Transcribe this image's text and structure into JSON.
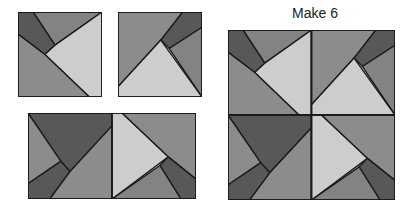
{
  "title": "Make 6",
  "colors": {
    "light": "#cdcdcd",
    "medium": "#8c8c8c",
    "medium_top": "#838383",
    "dark": "#585858",
    "border": "#1a1a1a"
  },
  "units": {
    "block_a": [
      {
        "name": "top-wedge",
        "fill": "medium_top",
        "points": "18,0 100,0 44,39"
      },
      {
        "name": "strip",
        "fill": "dark",
        "points": "0,0 18,0 44,39 32,50 0,26"
      },
      {
        "name": "big-triangle",
        "fill": "light",
        "points": "100,0 100,100 85,100 32,50 44,39"
      },
      {
        "name": "bottom-left",
        "fill": "medium",
        "points": "0,26 32,50 85,100 0,100"
      }
    ],
    "block_b": [
      {
        "name": "top-left",
        "fill": "medium",
        "points": "0,0 77,0 51,33 0,88"
      },
      {
        "name": "strip",
        "fill": "dark",
        "points": "77,0 100,0 100,18 61,43 51,33"
      },
      {
        "name": "right-wedge",
        "fill": "medium_top",
        "points": "100,18 100,100 61,43"
      },
      {
        "name": "big-triangle",
        "fill": "light",
        "points": "51,33 100,100 0,100 0,88"
      }
    ],
    "block_c": [
      {
        "name": "big-triangle",
        "fill": "dark",
        "points": "0,0 100,0 100,15 50,68 39,56"
      },
      {
        "name": "strip",
        "fill": "dark",
        "points": "0,100 0,82 39,56 50,68 26,100"
      },
      {
        "name": "left-wedge",
        "fill": "medium",
        "points": "0,0 39,56 0,82"
      },
      {
        "name": "bottom-right",
        "fill": "medium",
        "points": "100,15 100,100 26,100 50,68"
      }
    ],
    "block_d": [
      {
        "name": "big-triangle",
        "fill": "light",
        "points": "0,0 12,0 67,51 0,100"
      },
      {
        "name": "top-right",
        "fill": "medium",
        "points": "12,0 100,0 100,77 67,51"
      },
      {
        "name": "strip",
        "fill": "dark",
        "points": "100,77 100,100 82,100 57,61 67,51"
      },
      {
        "name": "bottom-wedge",
        "fill": "medium_top",
        "points": "0,100 57,61 82,100"
      }
    ]
  },
  "panels": [
    {
      "name": "unit-block-a",
      "left": 18,
      "top": 12,
      "width": 84,
      "height": 85,
      "cells": [
        {
          "block": "block_a",
          "col": 0,
          "row": 0
        }
      ],
      "cols": 1,
      "rows": 1
    },
    {
      "name": "unit-block-b",
      "left": 118,
      "top": 12,
      "width": 84,
      "height": 85,
      "cells": [
        {
          "block": "block_b",
          "col": 0,
          "row": 0
        }
      ],
      "cols": 1,
      "rows": 1
    },
    {
      "name": "unit-pair",
      "left": 28,
      "top": 113,
      "width": 168,
      "height": 86,
      "cells": [
        {
          "block": "block_c",
          "col": 0,
          "row": 0
        },
        {
          "block": "block_d",
          "col": 1,
          "row": 0
        }
      ],
      "cols": 2,
      "rows": 1
    },
    {
      "name": "finished-block",
      "left": 228,
      "top": 30,
      "width": 167,
      "height": 170,
      "cells": [
        {
          "block": "block_a",
          "col": 0,
          "row": 0
        },
        {
          "block": "block_b",
          "col": 1,
          "row": 0
        },
        {
          "block": "block_c",
          "col": 0,
          "row": 1
        },
        {
          "block": "block_d",
          "col": 1,
          "row": 1
        }
      ],
      "cols": 2,
      "rows": 2
    }
  ]
}
